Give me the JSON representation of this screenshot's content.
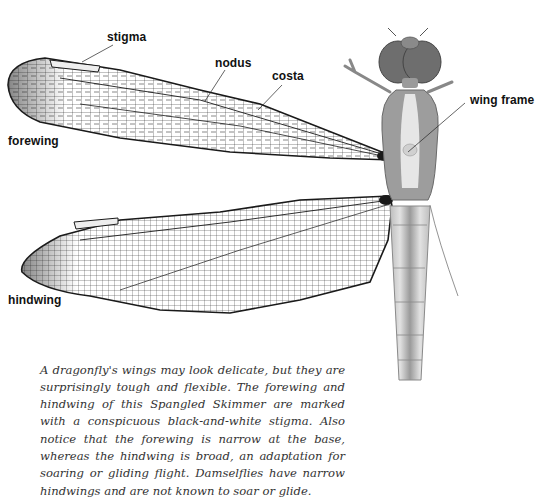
{
  "figure": {
    "labels": {
      "stigma": "stigma",
      "nodus": "nodus",
      "costa": "costa",
      "wing_frame": "wing frame",
      "forewing": "forewing",
      "hindwing": "hindwing"
    },
    "colors": {
      "vein": "#1a1a1a",
      "body": "#9a9a9a",
      "body_light": "#d8d8d8",
      "background": "#ffffff"
    }
  },
  "caption": {
    "text": "A dragonfly's wings may look delicate, but they are surprisingly tough and flexible. The forewing and hindwing of this Spangled Skimmer are marked with a conspicuous black-and-white stigma. Also notice that the forewing is narrow at the base, whereas the hindwing is broad, an adaptation for soaring or gliding flight. Damselflies have narrow hindwings and are not known to soar or glide."
  }
}
